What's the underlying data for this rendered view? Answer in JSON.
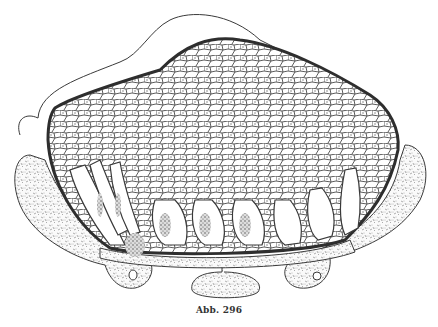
{
  "figure": {
    "caption": "Abb. 296",
    "colors": {
      "ink": "#3a3a3a",
      "paper": "#ffffff",
      "stipple": "#555555"
    }
  }
}
